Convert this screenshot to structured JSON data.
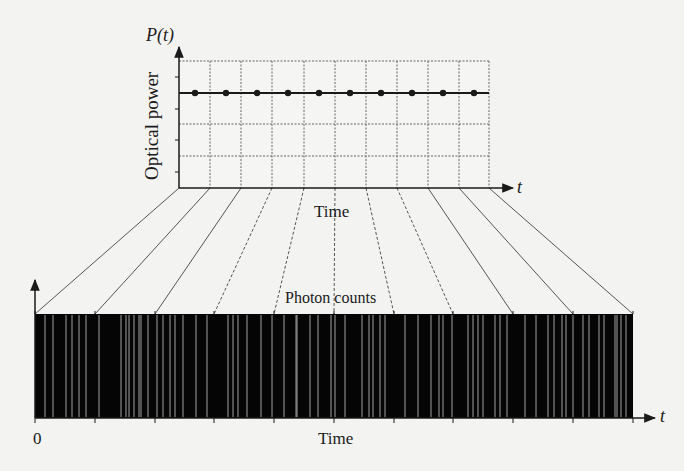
{
  "figure": {
    "background": "#f3f3f1",
    "ink_color": "#1a1a1a",
    "grid_color": "#666666",
    "counts_fill": "#050505",
    "counts_line_color": "#bdbdbd"
  },
  "top_chart": {
    "y_axis_label": "P(t)",
    "y_title": "Optical power",
    "x_axis_label": "t",
    "x_title": "Time",
    "box": {
      "left": 179,
      "right": 489,
      "top": 61,
      "bottom": 188
    },
    "h_grid_y": [
      61,
      124,
      156
    ],
    "v_grid_x": [
      210,
      241,
      272,
      304,
      335,
      366,
      397,
      428,
      459,
      489
    ],
    "y_ticks": [
      77,
      109,
      140,
      172
    ],
    "power_level_y": 93,
    "sample_points_x": [
      195,
      226,
      257,
      288,
      319,
      350,
      381,
      412,
      443,
      474
    ]
  },
  "bottom_chart": {
    "title": "Photon counts",
    "x_axis_label": "t",
    "x_title": "Time",
    "origin_label": "0",
    "box": {
      "left": 35,
      "right": 633,
      "top": 314,
      "bottom": 418
    },
    "tick_x": [
      35,
      95,
      155,
      214,
      274,
      334,
      394,
      453,
      513,
      573,
      633
    ],
    "photon_event_x": [
      45,
      53,
      66,
      72,
      79,
      86,
      99,
      121,
      126,
      129,
      134,
      139,
      141,
      148,
      157,
      163,
      170,
      175,
      183,
      196,
      207,
      228,
      233,
      238,
      247,
      261,
      272,
      284,
      296,
      297,
      310,
      318,
      331,
      335,
      345,
      362,
      369,
      373,
      380,
      385,
      405,
      418,
      431,
      439,
      443,
      452,
      468,
      473,
      478,
      483,
      495,
      500,
      507,
      525,
      536,
      548,
      554,
      562,
      566,
      573,
      583,
      589,
      599,
      604,
      615,
      617,
      621,
      626
    ]
  },
  "projection_lines": {
    "from_top_x": [
      179,
      210,
      241,
      272,
      304,
      335,
      366,
      397,
      428,
      459,
      489
    ],
    "to_bottom_x": [
      35,
      95,
      155,
      214,
      274,
      334,
      394,
      453,
      513,
      573,
      633
    ]
  }
}
